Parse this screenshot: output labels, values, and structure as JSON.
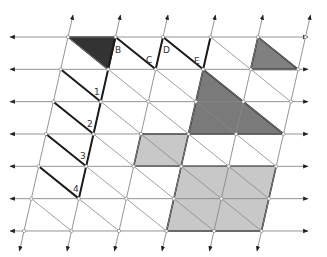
{
  "diagram": {
    "grid": {
      "origin_x": 68,
      "origin_y": 37,
      "col_step": 47.5,
      "row_step": 32.33,
      "skew_per_row": -7.33,
      "cols": 6,
      "rows": 7,
      "line_color": "#888888",
      "left_arrow_x": 10,
      "right_arrow_x": 308
    },
    "labels": [
      {
        "id": "B",
        "text": "B"
      },
      {
        "id": "C",
        "text": "C"
      },
      {
        "id": "D",
        "text": "D"
      },
      {
        "id": "E",
        "text": "E"
      },
      {
        "id": "1",
        "text": "1"
      },
      {
        "id": "2",
        "text": "2"
      },
      {
        "id": "3",
        "text": "3"
      },
      {
        "id": "4",
        "text": "4"
      }
    ],
    "shapes": [
      {
        "name": "dark-triangle-top-left",
        "fill": "#333333",
        "nodes": [
          [
            0,
            0
          ],
          [
            1,
            0
          ],
          [
            1,
            1
          ]
        ]
      },
      {
        "name": "gray-triangle-top-right",
        "fill": "#808080",
        "nodes": [
          [
            4,
            0
          ],
          [
            5,
            1
          ],
          [
            4,
            1
          ]
        ]
      },
      {
        "name": "large-triangle",
        "fill": "#7a7a7a",
        "nodes": [
          [
            3,
            1
          ],
          [
            5,
            3
          ],
          [
            3,
            3
          ]
        ]
      },
      {
        "name": "light-parallelogram-small",
        "fill": "#c8c8c8",
        "nodes": [
          [
            2,
            3
          ],
          [
            3,
            3
          ],
          [
            3,
            4
          ],
          [
            2,
            4
          ]
        ]
      },
      {
        "name": "light-parallelogram-large",
        "fill": "#c8c8c8",
        "nodes": [
          [
            3,
            4
          ],
          [
            5,
            4
          ],
          [
            5,
            6
          ],
          [
            3,
            6
          ]
        ]
      }
    ],
    "colors": {
      "dark": "#333333",
      "medium": "#7a7a7a",
      "light": "#c8c8c8",
      "grid": "#888888",
      "thick": "#1a1a1a"
    }
  }
}
